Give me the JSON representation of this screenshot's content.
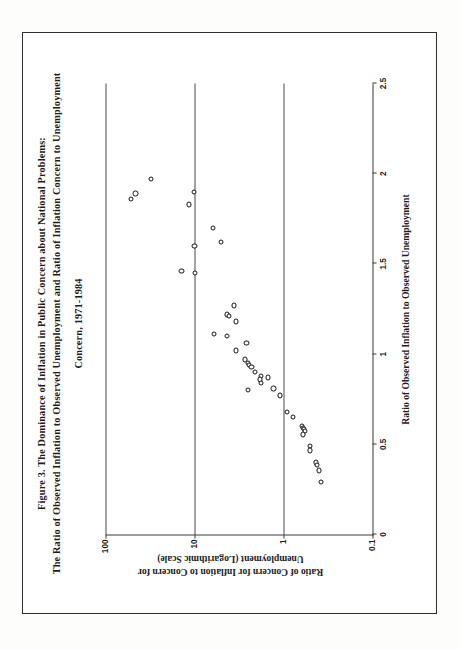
{
  "figure": {
    "title_lines": [
      "Figure 3.  The Dominance of Inflation in Public Concern about National Problems:",
      "The Ratio of Observed Inflation to Observed Unemployment and Ratio of Inflation Concern to Unemployment",
      "Concern, 1971-1984"
    ]
  },
  "chart_data": {
    "type": "scatter",
    "xlabel": "Ratio of Observed Inflation to Observed Unemployment",
    "ylabel_lines": [
      "Ratio of Concern for Inflation to Concern for",
      "Unemployment (Logarithmic Scale)"
    ],
    "ylabel": "Ratio of Concern for Inflation to Concern for Unemployment (Logarithmic Scale)",
    "xscale": "linear",
    "yscale": "log",
    "xlim": [
      0,
      2.5
    ],
    "ylim": [
      0.1,
      100
    ],
    "xticks": [
      0,
      0.5,
      1,
      1.5,
      2,
      2.5
    ],
    "xtick_labels": [
      "0",
      "0.5",
      "1",
      "1.5",
      "2",
      "2.5"
    ],
    "yticks": [
      0.1,
      1,
      10,
      100
    ],
    "ytick_labels": [
      "0.1",
      "1",
      "10",
      "100"
    ],
    "grid": "horizontal-major",
    "legend": null,
    "marker": "open-circle",
    "points": [
      {
        "x": 1.97,
        "y": 31.0
      },
      {
        "x": 1.86,
        "y": 52.0
      },
      {
        "x": 1.89,
        "y": 46.0
      },
      {
        "x": 1.9,
        "y": 10.2
      },
      {
        "x": 1.83,
        "y": 11.6
      },
      {
        "x": 1.7,
        "y": 6.2
      },
      {
        "x": 1.6,
        "y": 10.0
      },
      {
        "x": 1.62,
        "y": 5.0
      },
      {
        "x": 1.46,
        "y": 14.0
      },
      {
        "x": 1.45,
        "y": 9.8
      },
      {
        "x": 1.27,
        "y": 3.6
      },
      {
        "x": 1.22,
        "y": 4.3
      },
      {
        "x": 1.21,
        "y": 4.1
      },
      {
        "x": 1.18,
        "y": 3.4
      },
      {
        "x": 1.11,
        "y": 6.0
      },
      {
        "x": 1.1,
        "y": 4.3
      },
      {
        "x": 1.06,
        "y": 2.6
      },
      {
        "x": 1.02,
        "y": 3.4
      },
      {
        "x": 0.97,
        "y": 2.7
      },
      {
        "x": 0.95,
        "y": 2.5
      },
      {
        "x": 0.94,
        "y": 2.45
      },
      {
        "x": 0.93,
        "y": 2.3
      },
      {
        "x": 0.9,
        "y": 2.1
      },
      {
        "x": 0.88,
        "y": 1.8
      },
      {
        "x": 0.86,
        "y": 1.85
      },
      {
        "x": 0.84,
        "y": 1.8
      },
      {
        "x": 0.87,
        "y": 1.5
      },
      {
        "x": 0.8,
        "y": 2.5
      },
      {
        "x": 0.81,
        "y": 1.3
      },
      {
        "x": 0.77,
        "y": 1.1
      },
      {
        "x": 0.68,
        "y": 0.92
      },
      {
        "x": 0.65,
        "y": 0.78
      },
      {
        "x": 0.6,
        "y": 0.62
      },
      {
        "x": 0.59,
        "y": 0.6
      },
      {
        "x": 0.585,
        "y": 0.585
      },
      {
        "x": 0.575,
        "y": 0.57
      },
      {
        "x": 0.555,
        "y": 0.6
      },
      {
        "x": 0.49,
        "y": 0.5
      },
      {
        "x": 0.465,
        "y": 0.5
      },
      {
        "x": 0.4,
        "y": 0.43
      },
      {
        "x": 0.385,
        "y": 0.42
      },
      {
        "x": 0.355,
        "y": 0.4
      },
      {
        "x": 0.29,
        "y": 0.38
      }
    ]
  }
}
